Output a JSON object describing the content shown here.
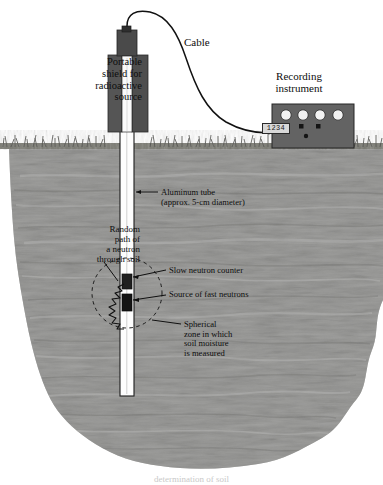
{
  "figure": {
    "caption": "determination of soil"
  },
  "labels": {
    "shield": "Portable\nshield for\nradioactive\nsource",
    "cable": "Cable",
    "recording_instrument": "Recording\ninstrument",
    "aluminum_tube": "Aluminum tube\n(approx. 5-cm diameter)",
    "random_path": "Random\npath of\na neutron\nthrough soil",
    "slow_neutron_counter": "Slow neutron counter",
    "source_fast_neutrons": "Source of fast neutrons",
    "spherical_zone": "Spherical\nzone in which\nsoil moisture\nis measured"
  },
  "instrument": {
    "readout_value": "1234",
    "dial_count": 4,
    "knob_count": 3
  },
  "colors": {
    "soil": "#9a9a98",
    "soil_dark": "#7d7d7b",
    "grass": "#6f6f6d",
    "shield": "#5b5b5b",
    "instrument": "#636363",
    "tube": "#fdfdfd",
    "ink": "#0d0d0d",
    "dial": "#f2f2f2"
  }
}
